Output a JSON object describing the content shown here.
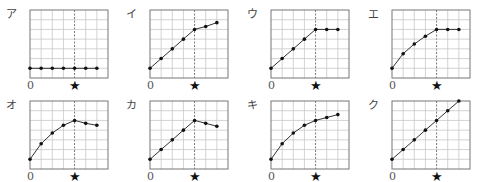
{
  "chart_data": [
    {
      "type": "line",
      "label": "ア",
      "x": [
        0,
        1,
        2,
        3,
        4,
        5,
        6
      ],
      "values": [
        1,
        1,
        1,
        1,
        1,
        1,
        1
      ],
      "marker_x": 4,
      "xlabel_origin": "0",
      "marker_symbol": "★",
      "ylim": [
        0,
        7
      ],
      "xlim": [
        0,
        7
      ],
      "grid": true
    },
    {
      "type": "line",
      "label": "イ",
      "x": [
        0,
        1,
        2,
        3,
        4,
        5,
        6
      ],
      "values": [
        1,
        2,
        3,
        4,
        5,
        5.3,
        5.7
      ],
      "marker_x": 4,
      "xlabel_origin": "0",
      "marker_symbol": "★",
      "ylim": [
        0,
        7
      ],
      "xlim": [
        0,
        7
      ],
      "grid": true
    },
    {
      "type": "line",
      "label": "ウ",
      "x": [
        0,
        1,
        2,
        3,
        4,
        5,
        6
      ],
      "values": [
        1,
        2,
        3,
        4,
        5,
        5,
        5
      ],
      "marker_x": 4,
      "xlabel_origin": "0",
      "marker_symbol": "★",
      "ylim": [
        0,
        7
      ],
      "xlim": [
        0,
        7
      ],
      "grid": true
    },
    {
      "type": "line",
      "label": "エ",
      "x": [
        0,
        1,
        2,
        3,
        4,
        5,
        6
      ],
      "values": [
        1,
        2.5,
        3.5,
        4.3,
        5,
        5,
        5
      ],
      "marker_x": 4,
      "xlabel_origin": "0",
      "marker_symbol": "★",
      "ylim": [
        0,
        7
      ],
      "xlim": [
        0,
        7
      ],
      "grid": true
    },
    {
      "type": "line",
      "label": "オ",
      "x": [
        0,
        1,
        2,
        3,
        4,
        5,
        6
      ],
      "values": [
        1,
        2.6,
        3.7,
        4.5,
        5,
        4.7,
        4.5
      ],
      "marker_x": 4,
      "xlabel_origin": "0",
      "marker_symbol": "★",
      "ylim": [
        0,
        7
      ],
      "xlim": [
        0,
        7
      ],
      "grid": true
    },
    {
      "type": "line",
      "label": "カ",
      "x": [
        0,
        1,
        2,
        3,
        4,
        5,
        6
      ],
      "values": [
        1,
        2,
        3,
        4,
        5,
        4.7,
        4.4
      ],
      "marker_x": 4,
      "xlabel_origin": "0",
      "marker_symbol": "★",
      "ylim": [
        0,
        7
      ],
      "xlim": [
        0,
        7
      ],
      "grid": true
    },
    {
      "type": "line",
      "label": "キ",
      "x": [
        0,
        1,
        2,
        3,
        4,
        5,
        6
      ],
      "values": [
        1,
        2.6,
        3.7,
        4.5,
        5,
        5.3,
        5.6
      ],
      "marker_x": 4,
      "xlabel_origin": "0",
      "marker_symbol": "★",
      "ylim": [
        0,
        7
      ],
      "xlim": [
        0,
        7
      ],
      "grid": true
    },
    {
      "type": "line",
      "label": "ク",
      "x": [
        0,
        1,
        2,
        3,
        4,
        5,
        6
      ],
      "values": [
        1,
        2,
        3,
        4,
        5,
        6,
        7
      ],
      "marker_x": 4,
      "xlabel_origin": "0",
      "marker_symbol": "★",
      "ylim": [
        0,
        7
      ],
      "xlim": [
        0,
        7
      ],
      "grid": true
    }
  ],
  "layout": {
    "panels": [
      {
        "left": 0,
        "top": 0
      },
      {
        "left": 120,
        "top": 0
      },
      {
        "left": 241,
        "top": 0
      },
      {
        "left": 362,
        "top": 0
      },
      {
        "left": 0,
        "top": 91
      },
      {
        "left": 120,
        "top": 91
      },
      {
        "left": 241,
        "top": 91
      },
      {
        "left": 362,
        "top": 91
      }
    ],
    "box": {
      "x": 30,
      "y": 10,
      "w": 78,
      "h": 68,
      "cols": 7,
      "rows": 7
    },
    "colors": {
      "grid": "#c8c8c8",
      "frame": "#777777",
      "line": "#333333",
      "point": "#111111",
      "dashed": "#555555"
    }
  }
}
